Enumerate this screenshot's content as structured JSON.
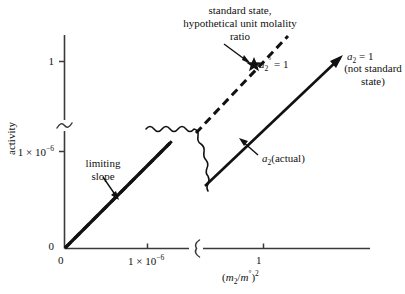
{
  "chart_data": {
    "type": "line",
    "title": "",
    "xlabel": "(m₂/m°)²",
    "ylabel": "activity",
    "grid": false,
    "legend": "none",
    "axis_breaks": {
      "x": true,
      "y": true,
      "note": "Both axes are broken between the 10⁻⁶ region and the unit region; a wavy break also crosses the plot interior."
    },
    "x_ticks": [
      "0",
      "1 × 10⁻⁶",
      "1"
    ],
    "y_ticks": [
      "0",
      "1 × 10⁻⁶",
      "1"
    ],
    "series": [
      {
        "name": "limiting slope (ideal, Henry's law)",
        "style": "dashed",
        "description": "Straight dashed line of constant limiting slope from the origin, extrapolated through the axis break to the standard state at a₂° = 1.",
        "points": [
          [
            0,
            0
          ],
          [
            1,
            1
          ]
        ]
      },
      {
        "name": "a₂(actual)",
        "style": "solid",
        "description": "Actual activity curve; coincides with the limiting slope near the origin, then falls below it and reaches a₂ = 1 at a molality ratio greater than 1.",
        "points": [
          [
            0,
            0
          ],
          [
            1.35,
            1
          ]
        ]
      }
    ],
    "markers": [
      {
        "name": "standard-state-marker",
        "glyph": "star",
        "label": "a₂° = 1",
        "on_series": "limiting slope (ideal, Henry's law)"
      },
      {
        "name": "actual-unit-activity-marker",
        "glyph": "arrowhead",
        "label": "a₂ = 1",
        "on_series": "a₂(actual)"
      }
    ],
    "annotations": [
      "standard state, hypothetical unit molality ratio",
      "a₂° = 1",
      "a₂ = 1",
      "(not standard state)",
      "limiting slope",
      "a₂(actual)"
    ]
  },
  "axes": {
    "y_label": "activity",
    "x_label_html": "(<span class=\"it\">m</span><sub>2</sub>/<span class=\"it\">m</span><sup>°</sup>)<sup>2</sup>",
    "y_ticks": {
      "one": "1",
      "micro_html": "1 × 10<sup>−6</sup>",
      "zero": "0"
    },
    "x_ticks": {
      "zero": "0",
      "micro_html": "1 × 10<sup>−6</sup>",
      "one": "1"
    }
  },
  "annotations": {
    "standard_state_line1": "standard state,",
    "standard_state_line2": "hypothetical unit molality",
    "standard_state_line3": "ratio",
    "a2_standard_html": "<span class=\"it\">a</span><sub>2</sub><sup>°</sup> = 1",
    "a2_unit_html": "<span class=\"it\">a</span><sub>2</sub> = 1",
    "not_standard_line1": "(not standard",
    "not_standard_line2": "state)",
    "limiting_line1": "limiting",
    "limiting_line2": "slope",
    "actual_html": "<span class=\"it\">a</span><sub>2</sub>(actual)"
  },
  "colors": {
    "ink": "#111111",
    "axis": "#3a3a3a",
    "background": "#ffffff"
  }
}
